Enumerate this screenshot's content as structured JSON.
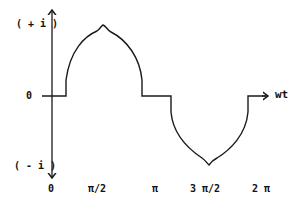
{
  "diagram": {
    "title": "",
    "y_axis": {
      "top_label": "( + i )",
      "zero_label": "0",
      "bottom_label": "( - i )"
    },
    "x_axis": {
      "label": "wt",
      "ticks": [
        "0",
        "π/2",
        "π",
        "3 π/2",
        "2 π"
      ]
    },
    "waveform": "Rectified-sine-like current pulse: positive lobe with cusp peak between small offset and π, zero from π to just past π, negative lobe with cusp trough around 3π/2, returning to zero before 2π",
    "colors": {
      "stroke": "#1a1a1a",
      "background": "#ffffff"
    }
  }
}
